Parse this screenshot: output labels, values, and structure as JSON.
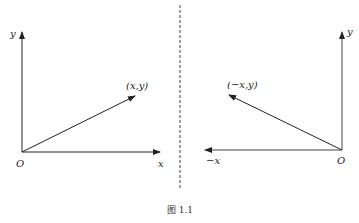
{
  "diagram": {
    "divider": {
      "style": "dashed",
      "x": 180
    },
    "left_panel": {
      "origin_label": "O",
      "x_axis_label": "x",
      "y_axis_label": "y",
      "vector_label": "(x,y)"
    },
    "right_panel": {
      "origin_label": "O",
      "x_axis_label": "−x",
      "y_axis_label": "y",
      "vector_label": "(−x,y)"
    },
    "caption": "图 1.1",
    "colors": {
      "stroke": "#222222",
      "background": "#ffffff"
    }
  }
}
